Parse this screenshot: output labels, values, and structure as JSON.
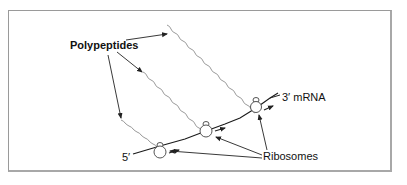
{
  "diagram": {
    "labels": {
      "polypeptides": "Polypeptides",
      "mrna_3prime": "3′ mRNA",
      "five_prime": "5′",
      "ribosomes": "Ribosomes"
    },
    "colors": {
      "frame": "#9a9a9a",
      "mrna": "#1a1a1a",
      "polypeptide": "#9a9a9a",
      "ribosome": "#555555",
      "arrow": "#222222",
      "text": "#111111"
    },
    "nodes": [
      {
        "id": "ribosome-1",
        "type": "ribosome",
        "x": 160,
        "y": 150
      },
      {
        "id": "ribosome-2",
        "type": "ribosome",
        "x": 206,
        "y": 129
      },
      {
        "id": "ribosome-3",
        "type": "ribosome",
        "x": 256,
        "y": 106
      }
    ],
    "edges": [
      {
        "from": "Polypeptides",
        "to": "polypeptide-3"
      },
      {
        "from": "Polypeptides",
        "to": "polypeptide-2"
      },
      {
        "from": "Polypeptides",
        "to": "polypeptide-1"
      },
      {
        "from": "Ribosomes",
        "to": "ribosome-1"
      },
      {
        "from": "Ribosomes",
        "to": "ribosome-2"
      },
      {
        "from": "Ribosomes",
        "to": "ribosome-3"
      }
    ]
  }
}
